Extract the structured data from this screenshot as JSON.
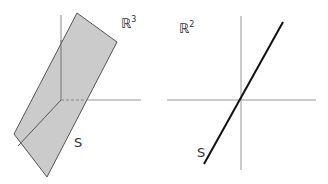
{
  "left_diagram": {
    "space_label": "ℝ",
    "space_exponent": "3",
    "subspace_label": "S",
    "plane_fill": "#c8c8c8",
    "plane_stroke": "#555555",
    "axis_color": "#888888"
  },
  "right_diagram": {
    "space_label": "ℝ",
    "space_exponent": "2",
    "subspace_label": "S",
    "line_color": "#111111",
    "axis_color": "#888888"
  }
}
